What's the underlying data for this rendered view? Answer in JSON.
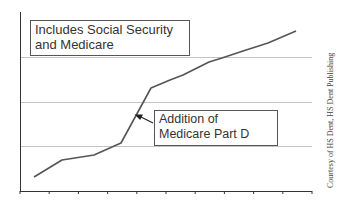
{
  "chart_data": {
    "type": "line",
    "title": "",
    "xlabel": "",
    "ylabel": "",
    "x_ticks_count": 11,
    "grid": "horizontal",
    "legend": "none",
    "series": [
      {
        "name": "Spending (Social Security and Medicare)",
        "color": "#555555",
        "points_px": [
          [
            34,
            177
          ],
          [
            62,
            160
          ],
          [
            94,
            155
          ],
          [
            121,
            143
          ],
          [
            151,
            88
          ],
          [
            170,
            80
          ],
          [
            183,
            75
          ],
          [
            209,
            62
          ],
          [
            222,
            58
          ],
          [
            243,
            51
          ],
          [
            268,
            43
          ],
          [
            296,
            31
          ]
        ],
        "values_relative": [
          0.31,
          0.66,
          0.76,
          1.0,
          2.22,
          2.36,
          2.47,
          2.76,
          2.85,
          3.0,
          3.18,
          3.44
        ]
      }
    ],
    "annotations": [
      {
        "text": "Includes Social Security and Medicare"
      },
      {
        "text": "Addition of Medicare Part D",
        "arrow_to": [
          136,
          116
        ]
      }
    ]
  },
  "notes": {
    "box1": "Includes Social Security and Medicare",
    "box2_line1": "Addition of",
    "box2_line2": "Medicare Part D"
  },
  "credit": "Courtesy of HS Dent, HS Dent Publishing",
  "colors": {
    "line": "#555555",
    "grid": "#bbbbbb",
    "axis": "#333333"
  }
}
